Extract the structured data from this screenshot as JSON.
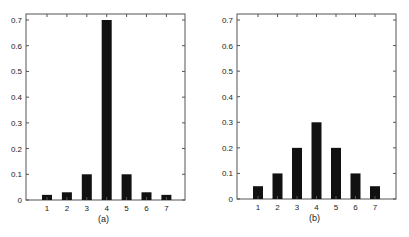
{
  "chart_data": [
    {
      "type": "bar",
      "title": "",
      "caption": "(a)",
      "xlabel": "",
      "ylabel": "",
      "categories": [
        "1",
        "2",
        "3",
        "4",
        "5",
        "6",
        "7"
      ],
      "values": [
        0.02,
        0.03,
        0.1,
        0.7,
        0.1,
        0.03,
        0.02
      ],
      "ylim": [
        0,
        0.72
      ],
      "yticks": [
        "0",
        "0.1",
        "0.2",
        "0.3",
        "0.4",
        "0.5",
        "0.6",
        "0.7"
      ],
      "grid": false,
      "legend": null,
      "bar_color": "#111111"
    },
    {
      "type": "bar",
      "title": "",
      "caption": "(b)",
      "xlabel": "",
      "ylabel": "",
      "categories": [
        "1",
        "2",
        "3",
        "4",
        "5",
        "6",
        "7"
      ],
      "values": [
        0.05,
        0.1,
        0.2,
        0.3,
        0.2,
        0.1,
        0.05
      ],
      "ylim": [
        0,
        0.72
      ],
      "yticks": [
        "0",
        "0.1",
        "0.2",
        "0.3",
        "0.4",
        "0.5",
        "0.6",
        "0.7"
      ],
      "grid": false,
      "legend": null,
      "bar_color": "#111111"
    }
  ]
}
